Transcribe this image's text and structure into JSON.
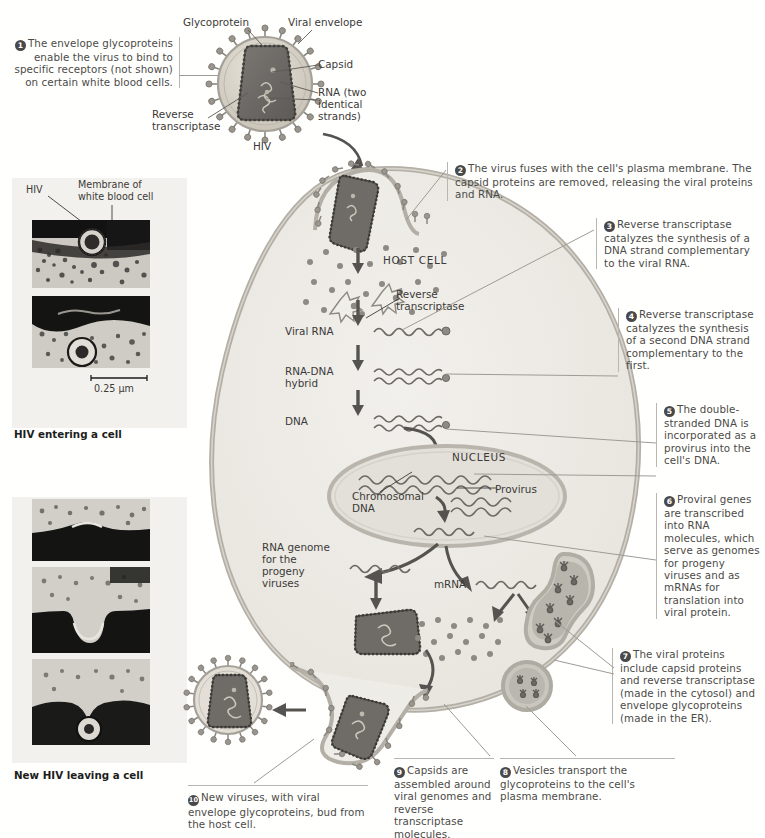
{
  "figure": {
    "virus_name": "HIV"
  },
  "top_labels": {
    "glycoprotein": "Glycoprotein",
    "viral_envelope": "Viral envelope",
    "capsid": "Capsid",
    "rna": "RNA (two\nidentical\nstrands)",
    "rna_l1": "RNA (two",
    "rna_l2": "identical",
    "rna_l3": "strands)",
    "reverse_transcriptase_l1": "Reverse",
    "reverse_transcriptase_l2": "transcriptase",
    "hiv": "HIV"
  },
  "steps": [
    {
      "n": "1",
      "text": "The envelope glycoproteins enable the virus to bind to specific receptors (not shown) on certain white blood cells."
    },
    {
      "n": "2",
      "text": "The virus fuses with the cell's plasma membrane. The capsid proteins are removed, releasing the viral proteins and RNA."
    },
    {
      "n": "3",
      "text": "Reverse transcriptase catalyzes the synthesis of a DNA strand complementary to the viral RNA."
    },
    {
      "n": "4",
      "text": "Reverse transcriptase catalyzes the synthesis of a second DNA strand complementary to the first."
    },
    {
      "n": "5",
      "text": "The double-stranded DNA is incorporated as a provirus into the cell's DNA."
    },
    {
      "n": "6",
      "text": "Proviral genes are transcribed into RNA molecules, which serve as genomes for progeny viruses and as mRNAs for translation into viral protein."
    },
    {
      "n": "7",
      "text": "The viral proteins include capsid proteins and reverse transcriptase (made in the cytosol) and envelope glycoproteins (made in the ER)."
    },
    {
      "n": "8",
      "text": "Vesicles transport the glycoproteins to the cell's plasma membrane."
    },
    {
      "n": "9",
      "text": "Capsids are assembled around viral genomes and reverse transcriptase molecules."
    },
    {
      "n": "10",
      "text": "New viruses, with viral envelope glycoproteins, bud from the host cell."
    }
  ],
  "cell_labels": {
    "host_cell": "HOST CELL",
    "reverse_transcriptase_l1": "Reverse",
    "reverse_transcriptase_l2": "transcriptase",
    "viral_rna": "Viral RNA",
    "rna_dna_hybrid_l1": "RNA-DNA",
    "rna_dna_hybrid_l2": "hybrid",
    "dna": "DNA",
    "nucleus": "NUCLEUS",
    "chromosomal_dna_l1": "Chromosomal",
    "chromosomal_dna_l2": "DNA",
    "provirus": "Provirus",
    "mrna": "mRNA",
    "rna_genome_l1": "RNA genome",
    "rna_genome_l2": "for the",
    "rna_genome_l3": "progeny",
    "rna_genome_l4": "viruses"
  },
  "micrographs": {
    "top": {
      "label_hiv": "HIV",
      "label_membrane_l1": "Membrane of",
      "label_membrane_l2": "white blood cell",
      "scale_bar": "0.25 µm",
      "caption": "HIV entering a cell"
    },
    "bottom": {
      "caption": "New HIV leaving a cell"
    }
  },
  "colors": {
    "envelope": "#cfc9bd",
    "capsid": "#6f6c68",
    "cytosol": "#eeece7",
    "nucleus": "#e0ddd6",
    "membrane": "#b3afa6",
    "spike": "#8a8780",
    "text": "#3a3a38",
    "rule": "#b9b6b2",
    "arrow": "#55534f"
  }
}
